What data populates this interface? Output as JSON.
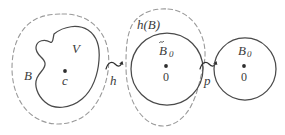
{
  "figure": {
    "background_color": "#ffffff",
    "dashed_stroke_color": "#9a9a9a",
    "solid_stroke_color": "#4a4a4a",
    "text_color": "#3c3c3c"
  },
  "regions": [
    {
      "id": "region-left",
      "outer_label": "B",
      "outer_style": "dashed-oval",
      "inner_label": "V",
      "inner_style": "solid-blob",
      "center_point_label": "c",
      "center_point_accent": "dot"
    },
    {
      "id": "region-middle",
      "outer_label": "h(B)",
      "outer_style": "dashed-blob",
      "inner_label": "B̃₀",
      "inner_label_base": "B",
      "inner_label_accent": "tilde",
      "inner_label_subscript": "0",
      "inner_style": "solid-circle",
      "center_point_label": "0",
      "center_point_accent": "dot"
    },
    {
      "id": "region-right",
      "outer_label": "",
      "inner_label": "B₀",
      "inner_label_base": "B",
      "inner_label_subscript": "0",
      "inner_style": "solid-circle",
      "center_point_label": "0",
      "center_point_accent": "dot"
    }
  ],
  "arrows": [
    {
      "id": "arrow-h",
      "label": "h",
      "glyph": "squiggly-arrow-right",
      "from": "region-left",
      "to": "region-middle"
    },
    {
      "id": "arrow-p",
      "label": "p",
      "glyph": "squiggly-arrow-right",
      "from": "region-middle",
      "to": "region-right"
    }
  ]
}
